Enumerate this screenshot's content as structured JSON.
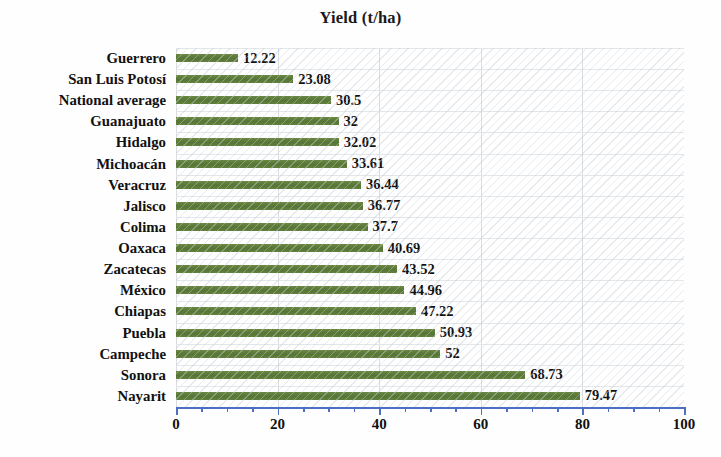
{
  "chart_data": {
    "type": "bar",
    "orientation": "horizontal",
    "title": "Yield (t/ha)",
    "xlabel": "",
    "ylabel": "",
    "xlim": [
      0,
      100
    ],
    "xticks": [
      0,
      20,
      40,
      60,
      80,
      100
    ],
    "xtick_labels": [
      "0",
      "20",
      "40",
      "60",
      "80",
      "100"
    ],
    "minor_tick_step": 5,
    "grid": true,
    "legend": false,
    "bar_color": "#5e7d3a",
    "axis_color": "#4a6fc4",
    "categories": [
      "Guerrero",
      "San Luis Potosí",
      "National average",
      "Guanajuato",
      "Hidalgo",
      "Michoacán",
      "Veracruz",
      "Jalisco",
      "Colima",
      "Oaxaca",
      "Zacatecas",
      "México",
      "Chiapas",
      "Puebla",
      "Campeche",
      "Sonora",
      "Nayarit"
    ],
    "values": [
      12.22,
      23.08,
      30.5,
      32,
      32.02,
      33.61,
      36.44,
      36.77,
      37.7,
      40.69,
      43.52,
      44.96,
      47.22,
      50.93,
      52,
      68.73,
      79.47
    ],
    "value_labels": [
      "12.22",
      "23.08",
      "30.5",
      "32",
      "32.02",
      "33.61",
      "36.44",
      "36.77",
      "37.7",
      "40.69",
      "43.52",
      "44.96",
      "47.22",
      "50.93",
      "52",
      "68.73",
      "79.47"
    ]
  }
}
